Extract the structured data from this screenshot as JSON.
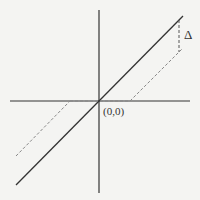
{
  "diagram": {
    "origin_label": "(0,0)",
    "delta_label": "Δ",
    "colors": {
      "background": "#f4f4f2",
      "line": "#333333",
      "dashed": "#777777"
    },
    "elements": {
      "x_axis": {
        "x1": 10,
        "y1": 101,
        "x2": 190,
        "y2": 101
      },
      "y_axis": {
        "x1": 99,
        "y1": 10,
        "x2": 99,
        "y2": 193
      },
      "solid_line": {
        "x1": 16,
        "y1": 185,
        "x2": 183,
        "y2": 16
      },
      "dashed_line_upper": {
        "x1": 130,
        "y1": 101,
        "x2": 183,
        "y2": 48
      },
      "dashed_line_lower": {
        "x1": 16,
        "y1": 156,
        "x2": 70,
        "y2": 101
      },
      "dashed_axis_segment": {
        "x1": 70,
        "y1": 101,
        "x2": 130,
        "y2": 101
      },
      "dashed_vertical_delta": {
        "x1": 179,
        "y1": 20,
        "x2": 179,
        "y2": 52
      }
    }
  }
}
